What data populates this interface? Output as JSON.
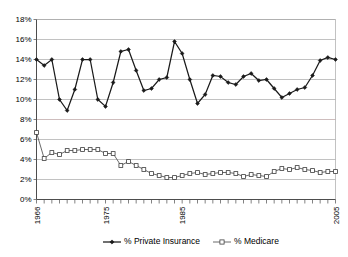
{
  "chart_data": {
    "type": "line",
    "title": "",
    "subtitle": "",
    "xlabel": "",
    "ylabel": "",
    "grid": true,
    "legend_position": "bottom",
    "ylim": [
      0,
      18
    ],
    "ytick_labels": [
      "0%",
      "2%",
      "4%",
      "6%",
      "8%",
      "10%",
      "12%",
      "14%",
      "16%",
      "18%"
    ],
    "ytick_values": [
      0,
      2,
      4,
      6,
      8,
      10,
      12,
      14,
      16,
      18
    ],
    "xlim": [
      1966,
      2005
    ],
    "xtick_labels": [
      "1966",
      "1975",
      "1985",
      "2005"
    ],
    "xtick_values": [
      1966,
      1975,
      1985,
      2005
    ],
    "x": [
      1966,
      1967,
      1968,
      1969,
      1970,
      1971,
      1972,
      1973,
      1974,
      1975,
      1976,
      1977,
      1978,
      1979,
      1980,
      1981,
      1982,
      1983,
      1984,
      1985,
      1986,
      1987,
      1988,
      1989,
      1990,
      1991,
      1992,
      1993,
      1994,
      1995,
      1996,
      1997,
      1998,
      1999,
      2000,
      2001,
      2002,
      2003,
      2004,
      2005
    ],
    "series": [
      {
        "name": "% Private Insurance",
        "marker": "filled-diamond",
        "color": "#1a1a1a",
        "values": [
          14.0,
          13.4,
          14.0,
          10.0,
          8.9,
          11.0,
          14.0,
          14.0,
          10.0,
          9.3,
          11.7,
          14.8,
          15.0,
          12.9,
          10.9,
          11.1,
          12.0,
          12.2,
          15.8,
          14.6,
          12.0,
          9.6,
          10.5,
          12.4,
          12.3,
          11.7,
          11.5,
          12.3,
          12.6,
          11.9,
          12.0,
          11.1,
          10.2,
          10.6,
          11.0,
          11.2,
          12.4,
          13.9,
          14.2,
          14.0
        ]
      },
      {
        "name": "% Medicare",
        "marker": "open-square",
        "color": "#595959",
        "values": [
          6.7,
          4.1,
          4.7,
          4.5,
          4.9,
          4.9,
          5.0,
          5.0,
          5.0,
          4.6,
          4.6,
          3.4,
          3.8,
          3.4,
          3.0,
          2.6,
          2.4,
          2.2,
          2.2,
          2.4,
          2.6,
          2.7,
          2.5,
          2.6,
          2.7,
          2.7,
          2.6,
          2.3,
          2.5,
          2.4,
          2.3,
          2.8,
          3.1,
          3.0,
          3.2,
          3.0,
          2.9,
          2.7,
          2.8,
          2.8
        ]
      }
    ]
  },
  "legend": {
    "items": [
      {
        "label": "% Private Insurance"
      },
      {
        "label": "% Medicare"
      }
    ]
  }
}
